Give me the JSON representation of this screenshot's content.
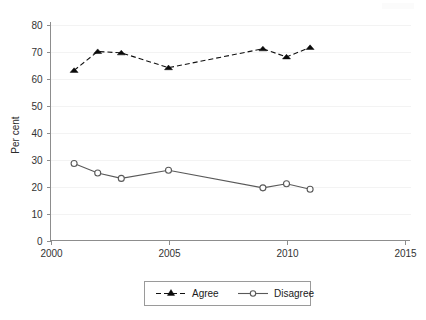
{
  "chart_data": {
    "type": "line",
    "title": "",
    "subtitle": "",
    "xlabel": "",
    "ylabel": "Per cent",
    "xlim": [
      2000,
      2015
    ],
    "ylim": [
      0,
      80
    ],
    "xticks": [
      2000,
      2005,
      2010,
      2015
    ],
    "xtick_labels": [
      "2000",
      "2005",
      "2010",
      "2015"
    ],
    "yticks": [
      0,
      10,
      20,
      30,
      40,
      50,
      60,
      70,
      80
    ],
    "ytick_labels": [
      "0",
      "10",
      "20",
      "30",
      "40",
      "50",
      "60",
      "70",
      "80"
    ],
    "grid": true,
    "grid_axis": "y",
    "legend_position": "bottom-center",
    "series": [
      {
        "name": "Agree",
        "marker": "triangle",
        "linestyle": "dashed",
        "color": "#111111",
        "x": [
          2001,
          2002,
          2003,
          2005,
          2009,
          2010,
          2011
        ],
        "values": [
          63,
          70,
          69.5,
          64,
          71,
          68,
          71.5
        ]
      },
      {
        "name": "Disagree",
        "marker": "circle",
        "linestyle": "solid",
        "color": "#595959",
        "x": [
          2001,
          2002,
          2003,
          2005,
          2009,
          2010,
          2011
        ],
        "values": [
          28.5,
          25,
          23,
          26,
          19.5,
          21,
          19
        ]
      }
    ]
  },
  "axes": {
    "y_axis_title": "Per cent"
  },
  "legend": {
    "entries": [
      {
        "label": "Agree"
      },
      {
        "label": "Disagree"
      }
    ]
  },
  "ticks": {
    "y": [
      "80",
      "70",
      "60",
      "50",
      "40",
      "30",
      "20",
      "10",
      "0"
    ],
    "x": [
      "2000",
      "2005",
      "2010",
      "2015"
    ]
  }
}
